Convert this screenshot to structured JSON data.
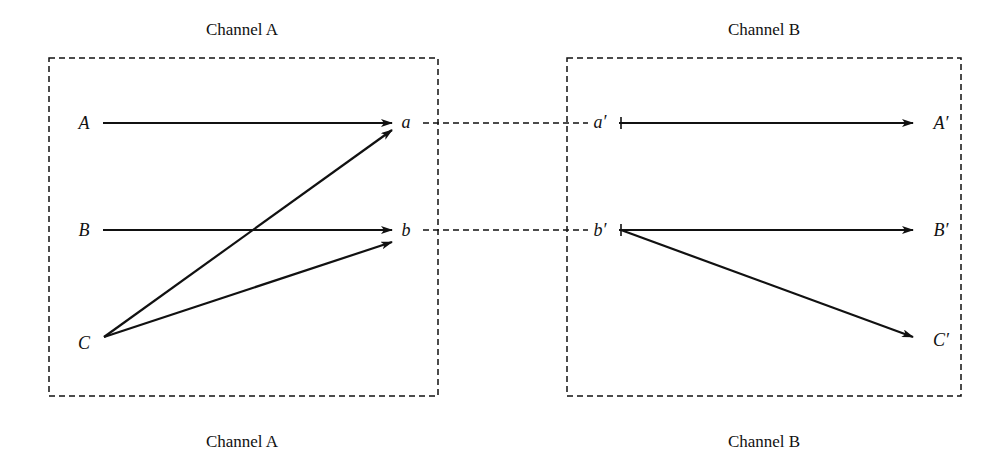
{
  "diagram": {
    "channels": [
      {
        "id": "A",
        "title_top": "Channel A",
        "title_bottom": "Channel A",
        "inputs": [
          "A",
          "B",
          "C"
        ],
        "outputs": [
          "a",
          "b"
        ]
      },
      {
        "id": "B",
        "title_top": "Channel B",
        "title_bottom": "Channel B",
        "inputs": [
          "a′",
          "b′"
        ],
        "outputs": [
          "A′",
          "B′",
          "C′"
        ]
      }
    ],
    "edges": [
      {
        "from": "A",
        "to": "a"
      },
      {
        "from": "B",
        "to": "b"
      },
      {
        "from": "C",
        "to": "a"
      },
      {
        "from": "C",
        "to": "b"
      },
      {
        "from": "a",
        "to": "a′",
        "style": "dashed"
      },
      {
        "from": "b",
        "to": "b′",
        "style": "dashed"
      },
      {
        "from": "a′",
        "to": "A′"
      },
      {
        "from": "b′",
        "to": "B′"
      },
      {
        "from": "b′",
        "to": "C′"
      }
    ],
    "colors": {
      "stroke": "#111111",
      "background": "#ffffff"
    }
  }
}
